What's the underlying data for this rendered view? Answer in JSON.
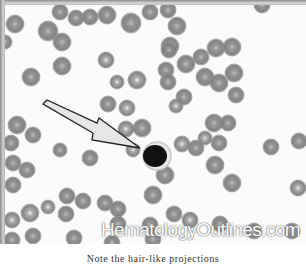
{
  "figure": {
    "watermark": "HematologyOutlines.com",
    "caption": "Note the hair-like projections",
    "arrow_label": "arrow"
  },
  "colors": {
    "background": "#fbfbfb",
    "rbc_fill": "#8e8e8e",
    "rbc_edge": "#6e6e6e",
    "lymphocyte_nucleus": "#111111",
    "arrow_fill": "#e6e6e6",
    "arrow_stroke": "#222222"
  }
}
